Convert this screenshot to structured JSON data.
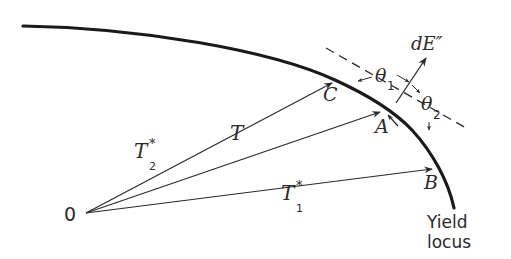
{
  "figure": {
    "origin_label": "0",
    "vectors": [
      {
        "name": "T2*",
        "base": "T",
        "sup": "*",
        "sub": "2",
        "endpoint": "C"
      },
      {
        "name": "T",
        "base": "T",
        "sup": "",
        "sub": "",
        "endpoint": "A"
      },
      {
        "name": "T1*",
        "base": "T",
        "sup": "*",
        "sub": "1",
        "endpoint": "B"
      }
    ],
    "points": {
      "c": "C",
      "a": "A",
      "b": "B"
    },
    "normal_label": "dE″",
    "angles": {
      "theta1": {
        "sym": "θ",
        "sub": "1"
      },
      "theta2": {
        "sym": "θ",
        "sub": "2"
      }
    },
    "curve_label": {
      "line1": "Yield",
      "line2": "locus"
    }
  },
  "colors": {
    "ink": "#2a2a2a",
    "background": "#ffffff"
  }
}
